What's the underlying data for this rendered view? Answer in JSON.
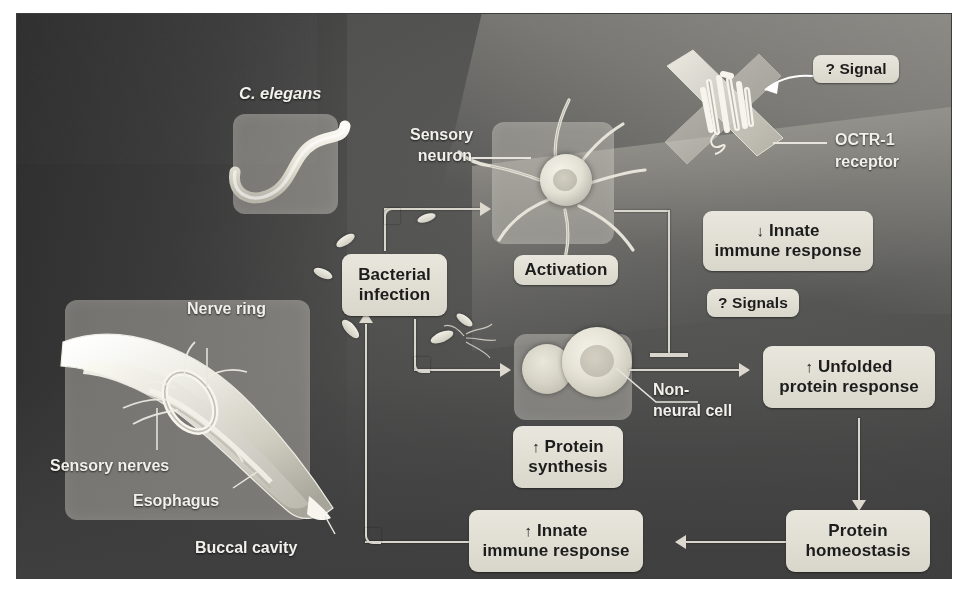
{
  "figure": {
    "organism_label": "C. elegans",
    "background_color": "#4a4a4a",
    "pill_color": "#e3e1d6",
    "line_color": "#d8d6cc"
  },
  "anatomy_labels": {
    "nerve_ring": "Nerve ring",
    "sensory_nerves": "Sensory nerves",
    "esophagus": "Esophagus",
    "buccal_cavity": "Buccal cavity",
    "sensory_neuron": "Sensory\nneuron",
    "sensory_neuron_line1": "Sensory",
    "sensory_neuron_line2": "neuron",
    "non_neural_cell_line1": "Non-",
    "non_neural_cell_line2": "neural cell",
    "octr1_line1": "OCTR-1",
    "octr1_line2": "receptor"
  },
  "nodes": [
    {
      "id": "bacterial-infection",
      "line1": "Bacterial",
      "line2": "infection",
      "arrow": ""
    },
    {
      "id": "activation",
      "line1": "Activation",
      "line2": "",
      "arrow": ""
    },
    {
      "id": "signal-question",
      "line1": "? Signal",
      "line2": "",
      "arrow": ""
    },
    {
      "id": "innate-down",
      "line1": "Innate",
      "line2": "immune response",
      "arrow": "↓"
    },
    {
      "id": "signals-question",
      "line1": "? Signals",
      "line2": "",
      "arrow": ""
    },
    {
      "id": "unfolded-protein",
      "line1": "Unfolded",
      "line2": "protein response",
      "arrow": "↑"
    },
    {
      "id": "protein-synthesis",
      "line1": "Protein",
      "line2": "synthesis",
      "arrow": "↑"
    },
    {
      "id": "protein-homeostasis",
      "line1": "Protein",
      "line2": "homeostasis",
      "arrow": ""
    },
    {
      "id": "innate-up",
      "line1": "Innate",
      "line2": "immune response",
      "arrow": "↑"
    }
  ],
  "edges": [
    {
      "from": "bacterial-infection",
      "to": "activation",
      "kind": "arrow"
    },
    {
      "from": "bacterial-infection",
      "to": "non-neural-cell",
      "kind": "arrow"
    },
    {
      "from": "activation",
      "to": "unfolded-protein",
      "kind": "inhibition"
    },
    {
      "from": "non-neural-cell",
      "to": "unfolded-protein",
      "kind": "arrow"
    },
    {
      "from": "unfolded-protein",
      "to": "protein-homeostasis",
      "kind": "arrow"
    },
    {
      "from": "protein-homeostasis",
      "to": "innate-up",
      "kind": "arrow"
    },
    {
      "from": "innate-up",
      "to": "bacterial-infection",
      "kind": "arrow"
    },
    {
      "from": "signal-question",
      "to": "octr1-receptor",
      "kind": "pointer"
    }
  ]
}
